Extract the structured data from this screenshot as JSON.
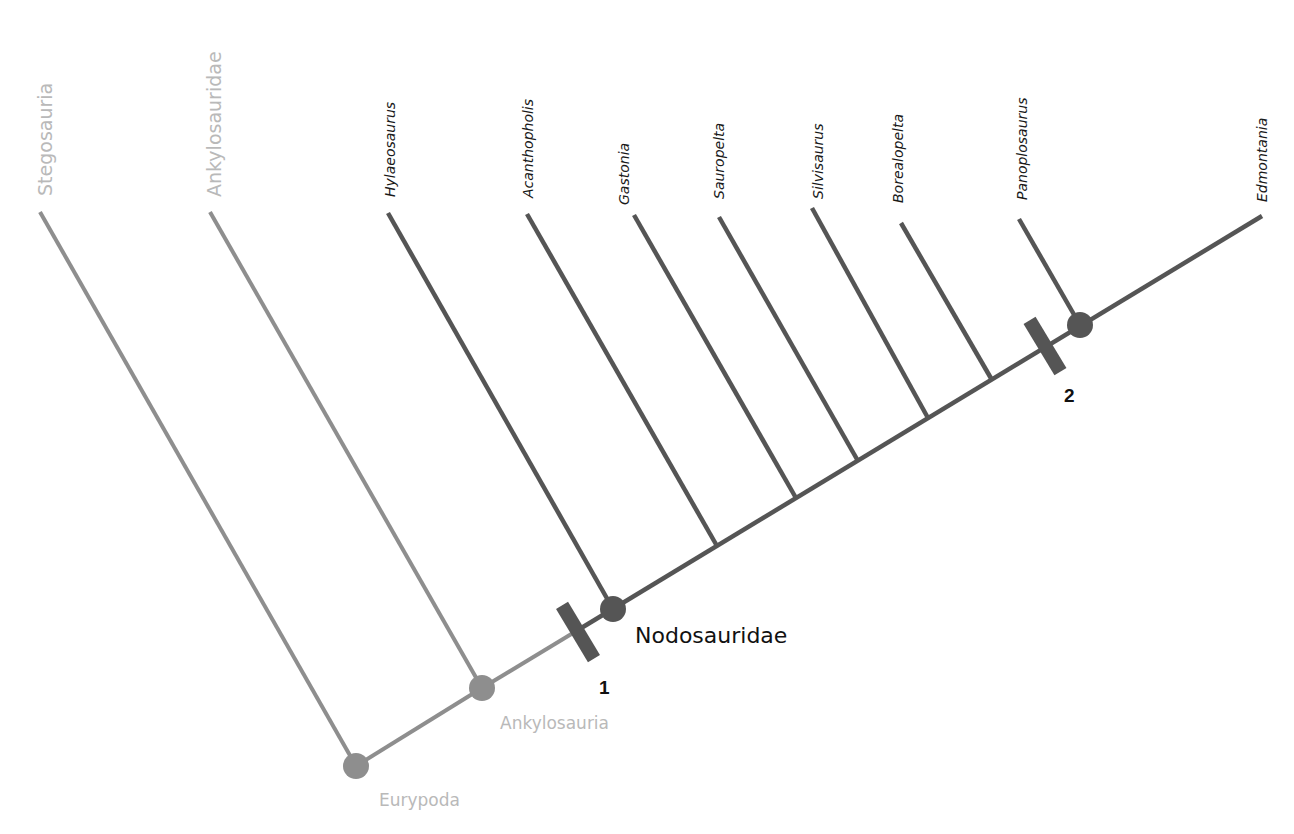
{
  "diagram": {
    "type": "cladogram",
    "colors": {
      "outgroup_line": "#8e8e8e",
      "ingroup_line": "#555555",
      "outgroup_text": "#b9b9b9",
      "ingroup_text": "#1a1a1a",
      "synapomorphy_bar": "#555555"
    },
    "taxa": [
      {
        "name": "Stegosauria",
        "group": "outgroup"
      },
      {
        "name": "Ankylosauridae",
        "group": "outgroup"
      },
      {
        "name": "Hylaeosaurus",
        "group": "ingroup"
      },
      {
        "name": "Acanthopholis",
        "group": "ingroup"
      },
      {
        "name": "Gastonia",
        "group": "ingroup"
      },
      {
        "name": "Sauropelta",
        "group": "ingroup"
      },
      {
        "name": "Silvisaurus",
        "group": "ingroup"
      },
      {
        "name": "Borealopelta",
        "group": "ingroup"
      },
      {
        "name": "Panoplosaurus",
        "group": "ingroup"
      },
      {
        "name": "Edmontania",
        "group": "ingroup"
      }
    ],
    "clades": [
      {
        "name": "Eurypoda",
        "group": "outgroup"
      },
      {
        "name": "Ankylosauria",
        "group": "outgroup"
      },
      {
        "name": "Nodosauridae",
        "group": "main"
      }
    ],
    "synapomorphies": [
      {
        "label": "1",
        "position": "base of Nodosauridae"
      },
      {
        "label": "2",
        "position": "base of Panoplosaurus + Edmontania"
      }
    ]
  }
}
